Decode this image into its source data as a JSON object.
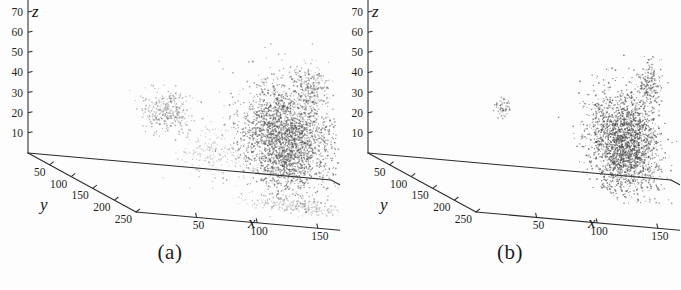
{
  "figure": {
    "name": "two-panel-3d-point-cloud-figure",
    "background_color": "#fdfdfd",
    "ink_color": "#2a2a2a",
    "point_color": "#4a4a4a"
  },
  "panels": [
    {
      "id": "a",
      "caption": "(a)",
      "chart_data": {
        "type": "scatter",
        "title": "",
        "subtitle": "",
        "projection": "3d",
        "xlabel": "x",
        "ylabel": "y",
        "zlabel": "z",
        "xlim": [
          250,
          0
        ],
        "ylim": [
          0,
          250
        ],
        "zlim": [
          0,
          70
        ],
        "xticks": [
          250,
          200,
          150,
          100,
          50
        ],
        "yticks": [
          50,
          100,
          150,
          200,
          250
        ],
        "zticks": [
          10,
          20,
          30,
          40,
          50,
          60,
          70
        ],
        "grid": false,
        "legend": "none",
        "annotations": [],
        "clusters": [
          {
            "name": "main-dense-cluster",
            "cx": 170,
            "cy": 120,
            "cz": 30,
            "n": 2600,
            "rx": 34,
            "ry": 40,
            "rz": 26,
            "density": "high"
          },
          {
            "name": "upper-spur",
            "cx": 198,
            "cy": 96,
            "cz": 55,
            "n": 240,
            "rx": 12,
            "ry": 14,
            "rz": 12,
            "density": "medium"
          },
          {
            "name": "left-satellite-cluster",
            "cx": 232,
            "cy": 142,
            "cz": 7,
            "n": 420,
            "rx": 20,
            "ry": 16,
            "rz": 7,
            "density": "medium"
          },
          {
            "name": "right-satellite-cluster",
            "cx": 82,
            "cy": 92,
            "cz": 36,
            "n": 300,
            "rx": 18,
            "ry": 16,
            "rz": 10,
            "density": "medium"
          },
          {
            "name": "diagonal-streak",
            "cx": 108,
            "cy": 120,
            "cz": 22,
            "n": 190,
            "rx": 26,
            "ry": 22,
            "rz": 12,
            "density": "low"
          },
          {
            "name": "ground-scatter",
            "cx": 165,
            "cy": 168,
            "cz": 2,
            "n": 280,
            "rx": 44,
            "ry": 26,
            "rz": 3,
            "density": "low"
          }
        ]
      }
    },
    {
      "id": "b",
      "caption": "(b)",
      "chart_data": {
        "type": "scatter",
        "title": "",
        "subtitle": "",
        "projection": "3d",
        "xlabel": "x",
        "ylabel": "y",
        "zlabel": "z",
        "xlim": [
          250,
          0
        ],
        "ylim": [
          0,
          250
        ],
        "zlim": [
          0,
          70
        ],
        "xticks": [
          250,
          200,
          150,
          100,
          50
        ],
        "yticks": [
          50,
          100,
          150,
          200,
          250
        ],
        "zticks": [
          10,
          20,
          30,
          40,
          50,
          60,
          70
        ],
        "grid": false,
        "legend": "none",
        "annotations": [],
        "clusters": [
          {
            "name": "main-dense-cluster",
            "cx": 168,
            "cy": 120,
            "cz": 28,
            "n": 2200,
            "rx": 24,
            "ry": 30,
            "rz": 24,
            "density": "very-high"
          },
          {
            "name": "upper-spur",
            "cx": 196,
            "cy": 100,
            "cz": 56,
            "n": 200,
            "rx": 8,
            "ry": 10,
            "rz": 11,
            "density": "high"
          },
          {
            "name": "left-arrow-satellite",
            "cx": 236,
            "cy": 140,
            "cz": 8,
            "n": 230,
            "rx": 14,
            "ry": 12,
            "rz": 6,
            "density": "high"
          },
          {
            "name": "left-tail-streak",
            "cx": 222,
            "cy": 164,
            "cz": 2,
            "n": 150,
            "rx": 18,
            "ry": 12,
            "rz": 3,
            "density": "medium"
          },
          {
            "name": "right-isolated-blob",
            "cx": 76,
            "cy": 96,
            "cz": 38,
            "n": 60,
            "rx": 6,
            "ry": 6,
            "rz": 5,
            "density": "high"
          }
        ]
      }
    }
  ]
}
